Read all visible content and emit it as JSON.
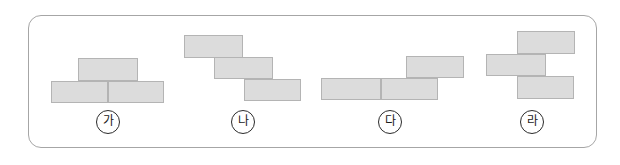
{
  "page": {
    "background_color": "#ffffff"
  },
  "frame": {
    "name": "rounded-outline-box",
    "border_color": "#a6a6a6",
    "fill_color": "#ffffff",
    "corner_radius_px": 13,
    "x": 28,
    "y": 15,
    "width": 569,
    "height": 133
  },
  "style": {
    "brick_fill": "#dcdcdc",
    "brick_stroke": "#b4b4b4",
    "label_stroke": "#2b2b2b",
    "label_text_color": "#1a1a1a"
  },
  "figures": [
    {
      "id": "ga",
      "label": "가",
      "label_center": {
        "x": 108,
        "y": 122
      },
      "brick_count": 3,
      "arrangement": "one brick centered on top of two bricks laid side by side",
      "bricks": [
        {
          "name": "brick-top",
          "x": 78,
          "y": 58,
          "w": 60,
          "h": 23
        },
        {
          "name": "brick-bottom-left",
          "x": 51,
          "y": 81,
          "w": 57,
          "h": 22
        },
        {
          "name": "brick-bottom-right",
          "x": 108,
          "y": 81,
          "w": 56,
          "h": 22
        }
      ]
    },
    {
      "id": "na",
      "label": "나",
      "label_center": {
        "x": 243,
        "y": 122
      },
      "brick_count": 3,
      "arrangement": "three bricks in a descending staircase from upper left to lower right",
      "bricks": [
        {
          "name": "brick-step-1",
          "x": 184,
          "y": 35,
          "w": 59,
          "h": 23
        },
        {
          "name": "brick-step-2",
          "x": 214,
          "y": 57,
          "w": 59,
          "h": 22
        },
        {
          "name": "brick-step-3",
          "x": 244,
          "y": 79,
          "w": 57,
          "h": 22
        }
      ]
    },
    {
      "id": "da",
      "label": "다",
      "label_center": {
        "x": 390,
        "y": 122
      },
      "brick_count": 3,
      "arrangement": "two bricks side by side with one brick on the upper right",
      "bricks": [
        {
          "name": "brick-top-right",
          "x": 406,
          "y": 56,
          "w": 58,
          "h": 22
        },
        {
          "name": "brick-bottom-left",
          "x": 321,
          "y": 78,
          "w": 60,
          "h": 22
        },
        {
          "name": "brick-bottom-right",
          "x": 381,
          "y": 78,
          "w": 57,
          "h": 22
        }
      ]
    },
    {
      "id": "ra",
      "label": "라",
      "label_center": {
        "x": 532,
        "y": 122
      },
      "brick_count": 3,
      "arrangement": "three stacked bricks offset in a zigzag: top right, middle left, bottom right",
      "bricks": [
        {
          "name": "brick-top",
          "x": 517,
          "y": 31,
          "w": 58,
          "h": 23
        },
        {
          "name": "brick-middle",
          "x": 486,
          "y": 54,
          "w": 60,
          "h": 22
        },
        {
          "name": "brick-bottom",
          "x": 517,
          "y": 76,
          "w": 57,
          "h": 23
        }
      ]
    }
  ]
}
